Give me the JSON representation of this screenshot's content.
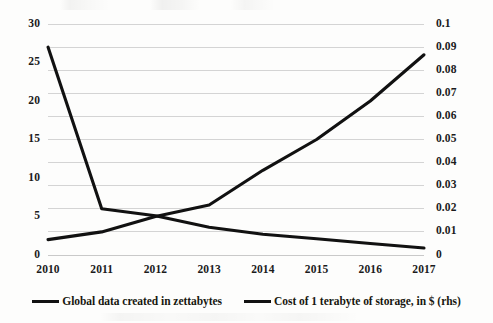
{
  "chart_data": {
    "type": "line",
    "title": "",
    "subtitle": "",
    "xlabel": "",
    "ylabel": "",
    "y2label": "",
    "grid": true,
    "legend_position": "bottom",
    "categories": [
      "2010",
      "2011",
      "2012",
      "2013",
      "2014",
      "2015",
      "2016",
      "2017"
    ],
    "x_tick_labels": [
      "2010",
      "2011",
      "2012",
      "2013",
      "2014",
      "2015",
      "2016",
      "2017"
    ],
    "ylim": [
      0,
      30
    ],
    "y_tick_labels": [
      "0",
      "5",
      "10",
      "15",
      "20",
      "25",
      "30"
    ],
    "y_ticks": [
      0,
      5,
      10,
      15,
      20,
      25,
      30
    ],
    "y2lim": [
      0,
      0.1
    ],
    "y2_tick_labels": [
      "0",
      "0.01",
      "0.02",
      "0.03",
      "0.04",
      "0.05",
      "0.06",
      "0.07",
      "0.08",
      "0.09",
      "0.1"
    ],
    "y2_ticks": [
      0,
      0.01,
      0.02,
      0.03,
      0.04,
      0.05,
      0.06,
      0.07,
      0.08,
      0.09,
      0.1
    ],
    "series": [
      {
        "name": "Global data created in zettabytes",
        "axis": "left",
        "color": "#111111",
        "values": [
          2,
          3,
          5,
          6.5,
          11,
          15,
          20,
          26
        ]
      },
      {
        "name": "Cost of 1 terabyte of storage, in $ (rhs)",
        "axis": "right",
        "color": "#111111",
        "values": [
          0.09,
          0.02,
          0.017,
          0.012,
          0.009,
          0.007,
          0.005,
          0.003
        ]
      }
    ]
  },
  "legend": {
    "entries": [
      {
        "label": "Global data created in zettabytes",
        "color": "#111111"
      },
      {
        "label": "Cost of 1 terabyte of storage, in $ (rhs)",
        "color": "#111111"
      }
    ]
  }
}
